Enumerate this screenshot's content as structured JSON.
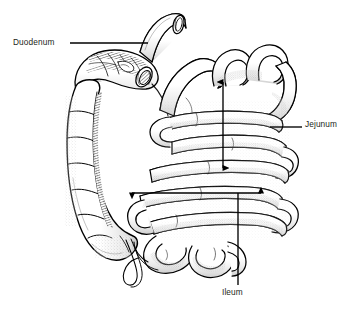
{
  "figure": {
    "style": "pen-and-ink stippled medical illustration",
    "background_color": "#ffffff",
    "ink_color": "#000000",
    "text_color": "#231f20"
  },
  "labels": [
    {
      "id": "duodenum",
      "text": "Duodenum",
      "text_x": 13,
      "text_y": 38,
      "leader": {
        "type": "line",
        "x1": 70,
        "y1": 43,
        "x2": 148,
        "y2": 43
      }
    },
    {
      "id": "jejunum",
      "text": "Jejunum",
      "text_x": 305,
      "text_y": 120,
      "leader": {
        "type": "line",
        "x1": 270,
        "y1": 127,
        "x2": 302,
        "y2": 127
      },
      "extent_arrow": {
        "type": "double-headed-vertical",
        "x": 223,
        "y_top": 78,
        "y_bottom": 172
      }
    },
    {
      "id": "ileum",
      "text": "Ileum",
      "text_x": 222,
      "text_y": 288,
      "leader": {
        "type": "line",
        "x1": 238,
        "y1": 193,
        "x2": 238,
        "y2": 285
      },
      "extent_arrow": {
        "type": "double-headed-horizontal",
        "y": 193,
        "x_left": 128,
        "x_right": 265
      }
    }
  ],
  "anatomy": {
    "parts": [
      "transverse-colon-cut-end",
      "duodenum",
      "ascending-colon",
      "cecum",
      "vermiform-appendix",
      "jejunum-loops",
      "ileum-loops"
    ]
  }
}
